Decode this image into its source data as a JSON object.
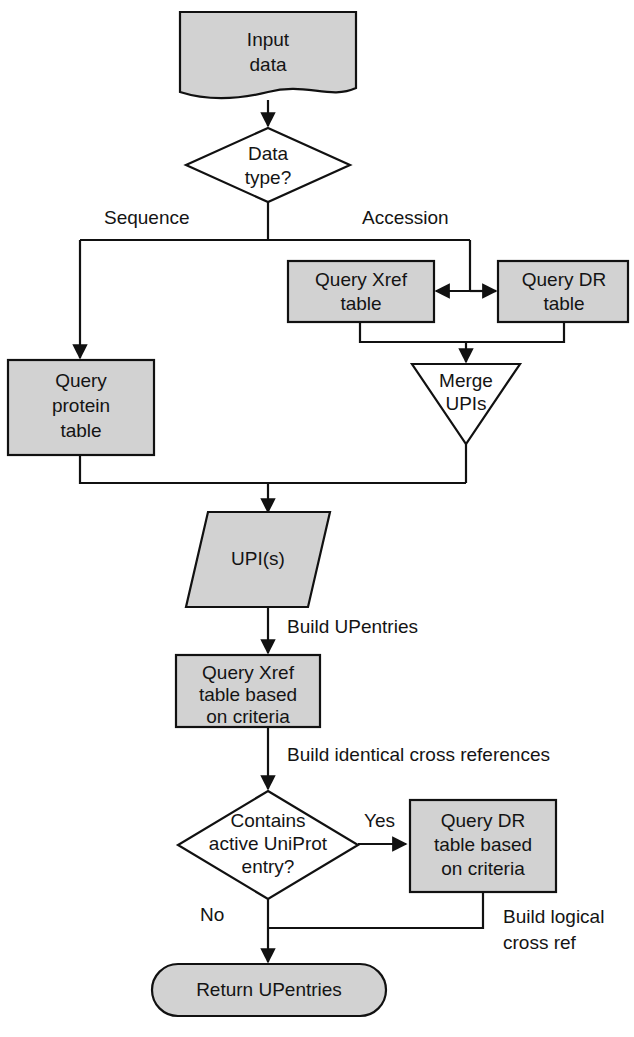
{
  "diagram": {
    "colors": {
      "node_fill_gray": "#d2d2d2",
      "node_fill_white": "#ffffff",
      "stroke": "#111111",
      "text": "#141414",
      "background": "#ffffff"
    },
    "nodes": {
      "input_data": {
        "line1": "Input",
        "line2": "data",
        "shape": "document"
      },
      "data_type": {
        "line1": "Data",
        "line2": "type?",
        "shape": "decision"
      },
      "query_xref_table": {
        "line1": "Query Xref",
        "line2": "table",
        "shape": "process"
      },
      "query_dr_table": {
        "line1": "Query DR",
        "line2": "table",
        "shape": "process"
      },
      "query_protein_table": {
        "line1": "Query",
        "line2": "protein",
        "line3": "table",
        "shape": "process"
      },
      "merge_upis": {
        "line1": "Merge",
        "line2": "UPIs",
        "shape": "merge-triangle"
      },
      "upis": {
        "line1": "UPI(s)",
        "shape": "data-parallelogram"
      },
      "query_xref_criteria": {
        "line1": "Query Xref",
        "line2": "table based",
        "line3": "on criteria",
        "shape": "process"
      },
      "contains_active_uniprot": {
        "line1": "Contains",
        "line2": "active UniProt",
        "line3": "entry?",
        "shape": "decision"
      },
      "query_dr_criteria": {
        "line1": "Query DR",
        "line2": "table based",
        "line3": "on criteria",
        "shape": "process"
      },
      "return_upentries": {
        "line1": "Return UPentries",
        "shape": "terminator"
      }
    },
    "edge_labels": {
      "sequence": "Sequence",
      "accession": "Accession",
      "build_upentries": "Build UPentries",
      "build_identical_cross_references": "Build identical cross references",
      "yes": "Yes",
      "no": "No",
      "build_logical_line1": "Build logical",
      "build_logical_line2": "cross ref"
    }
  }
}
